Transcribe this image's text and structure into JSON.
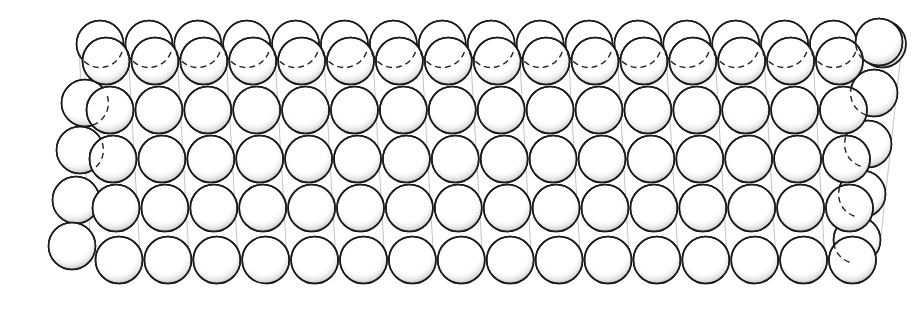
{
  "diagram": {
    "title": "",
    "colors": {
      "stroke": "#1a1a1a",
      "fill": "#ffffff",
      "guide": "#9a9a9a",
      "background": "#ffffff"
    },
    "radius": 23.5,
    "front_grid": {
      "rows": 5,
      "cols": 16,
      "col_spacing": 48.9,
      "row_starts": [
        {
          "x": 106,
          "y": 61
        },
        {
          "x": 110,
          "y": 110
        },
        {
          "x": 113,
          "y": 159
        },
        {
          "x": 116,
          "y": 208
        },
        {
          "x": 119,
          "y": 260
        }
      ]
    },
    "back_top_row": {
      "start_x": 100,
      "y": 44,
      "count": 17,
      "spacing": 48.9
    },
    "back_left_column": [
      {
        "x": 85,
        "y": 103
      },
      {
        "x": 80,
        "y": 150
      },
      {
        "x": 76,
        "y": 200
      },
      {
        "x": 72,
        "y": 246
      }
    ],
    "back_right_column": [
      {
        "x": 879,
        "y": 42
      },
      {
        "x": 874,
        "y": 93
      },
      {
        "x": 868,
        "y": 144
      },
      {
        "x": 862,
        "y": 194
      },
      {
        "x": 857,
        "y": 240
      }
    ]
  }
}
